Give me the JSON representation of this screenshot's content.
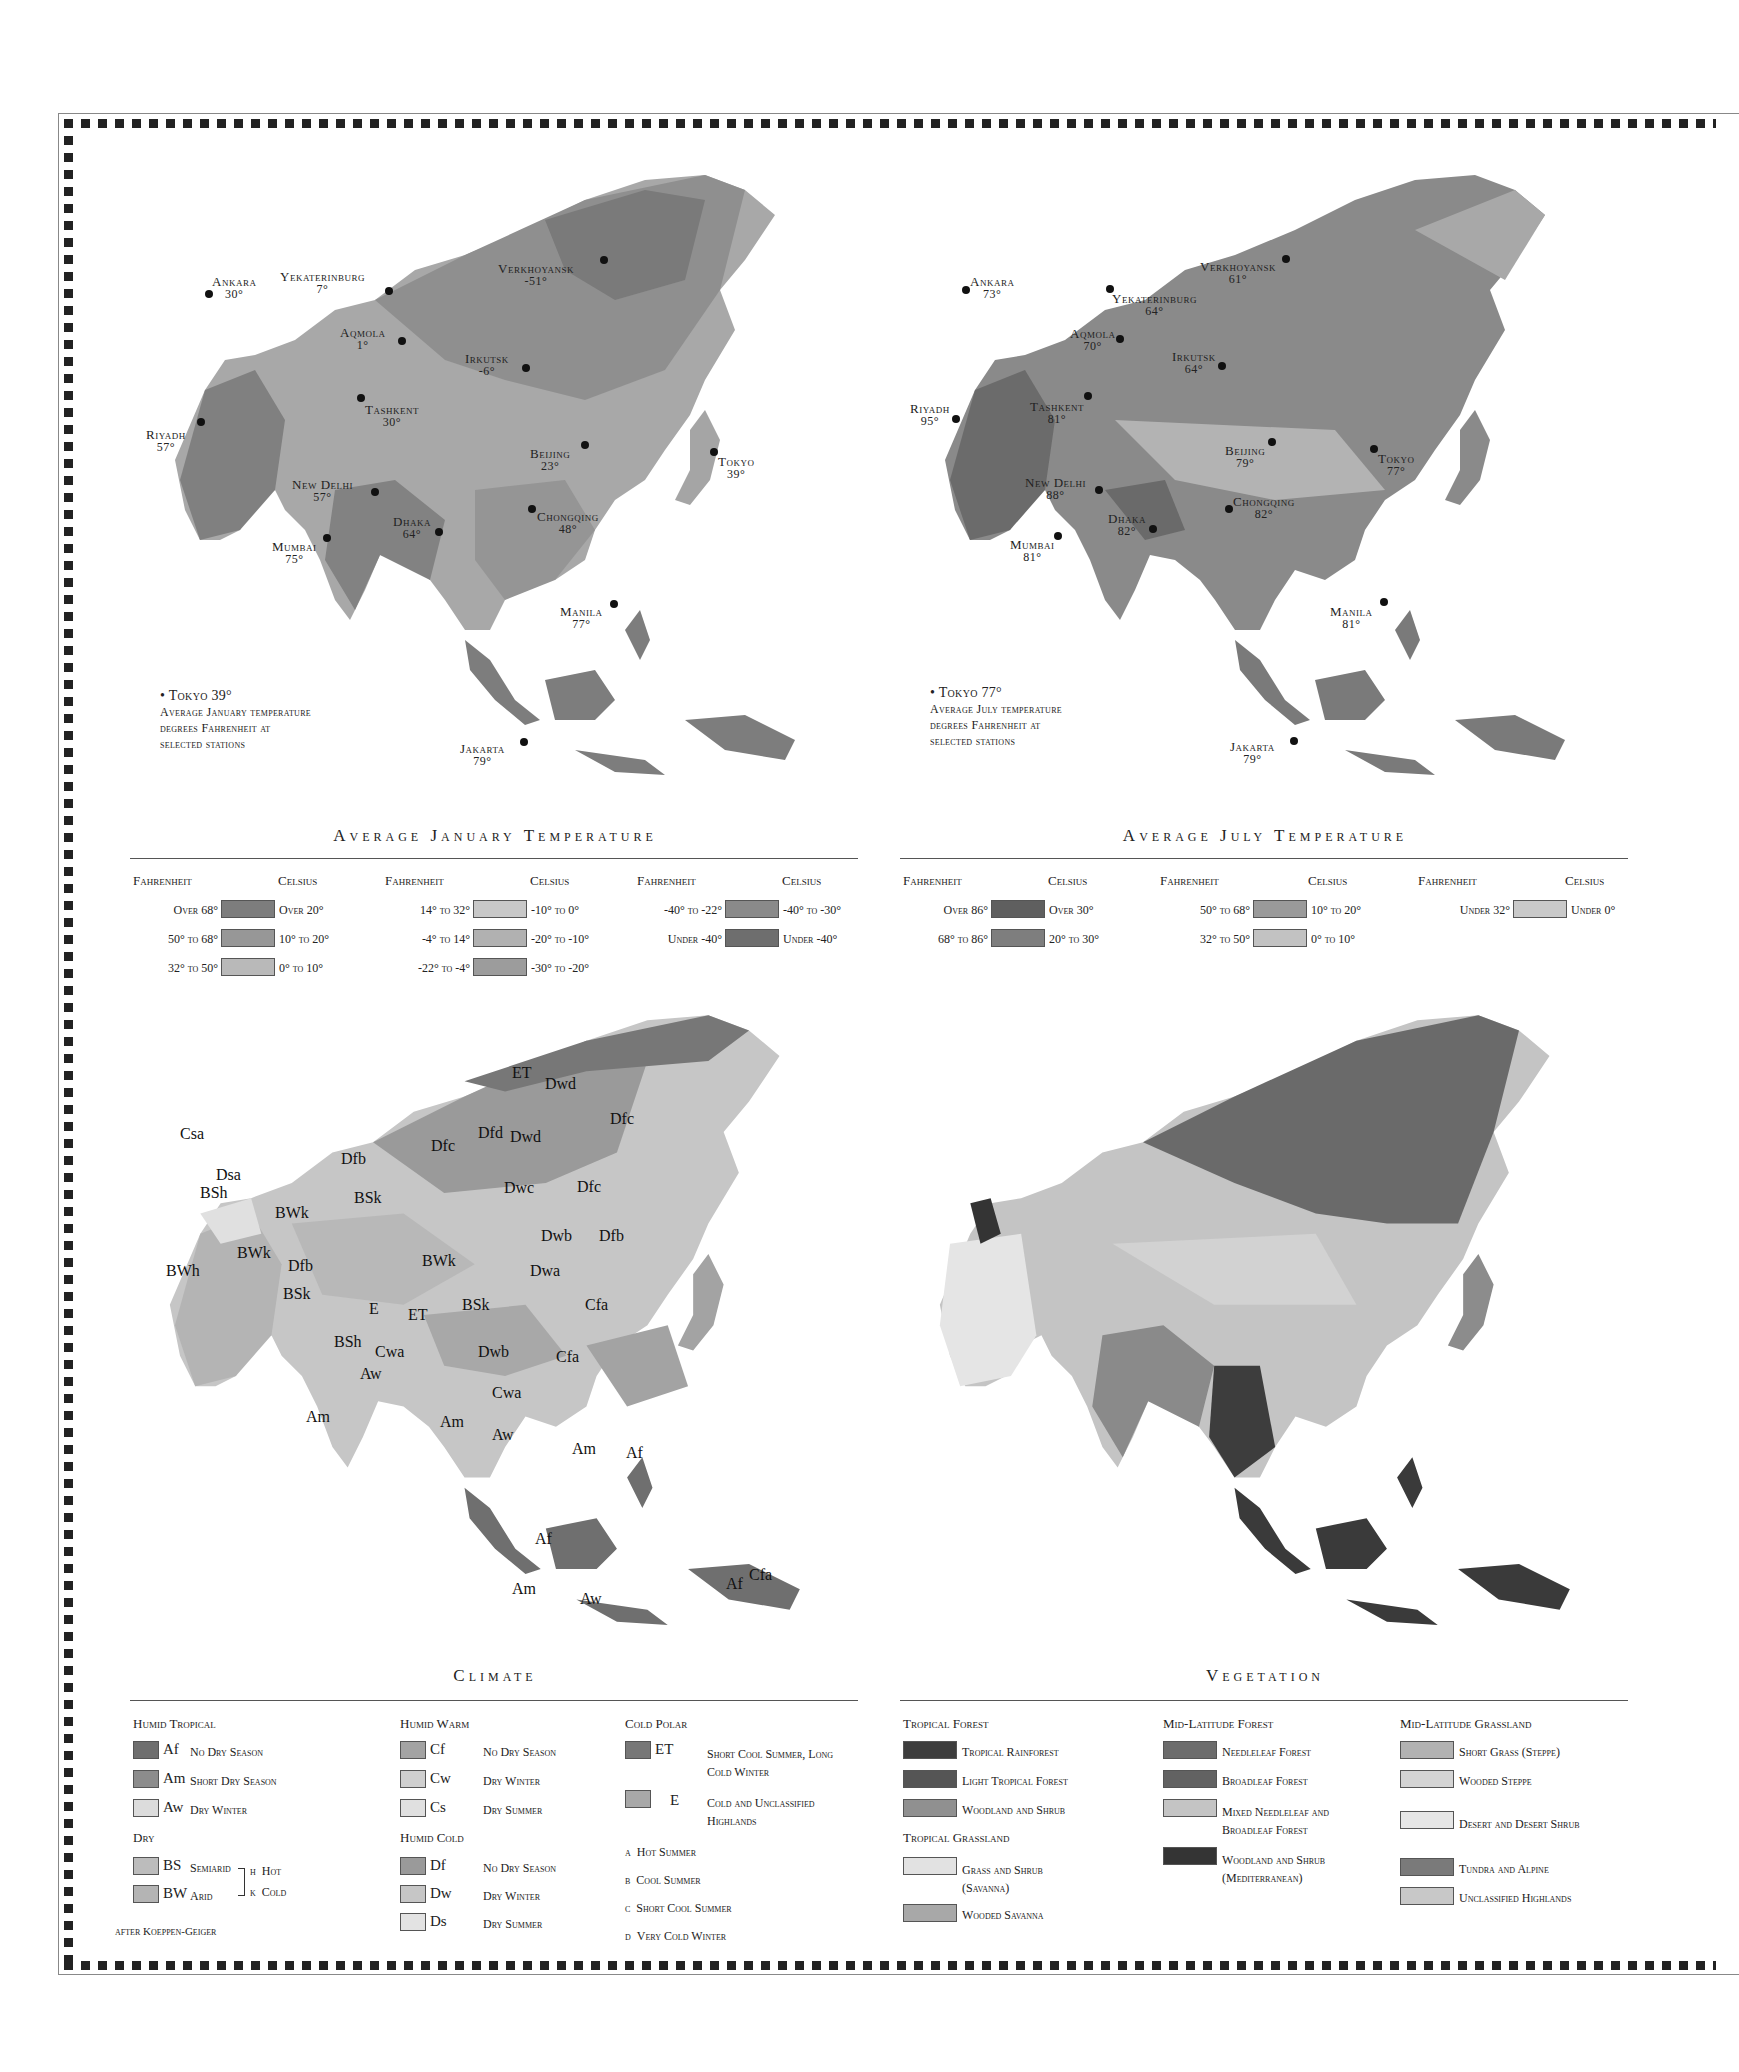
{
  "jan_map": {
    "title": "Average January Temperature",
    "note_key": "Tokyo 39°",
    "note_lines": [
      "Average January temperature",
      "degrees Fahrenheit at",
      "selected stations"
    ],
    "stations": [
      {
        "name": "Ankara",
        "temp": "30°"
      },
      {
        "name": "Yekaterinburg",
        "temp": "7°"
      },
      {
        "name": "Verkhoyansk",
        "temp": "-51°"
      },
      {
        "name": "Aqmola",
        "temp": "1°"
      },
      {
        "name": "Irkutsk",
        "temp": "-6°"
      },
      {
        "name": "Tashkent",
        "temp": "30°"
      },
      {
        "name": "Riyadh",
        "temp": "57°"
      },
      {
        "name": "Beijing",
        "temp": "23°"
      },
      {
        "name": "Tokyo",
        "temp": "39°"
      },
      {
        "name": "New Delhi",
        "temp": "57°"
      },
      {
        "name": "Dhaka",
        "temp": "64°"
      },
      {
        "name": "Chongqing",
        "temp": "48°"
      },
      {
        "name": "Mumbai",
        "temp": "75°"
      },
      {
        "name": "Manila",
        "temp": "77°"
      },
      {
        "name": "Jakarta",
        "temp": "79°"
      }
    ]
  },
  "jan_legend": {
    "fahrenheit_label": "Fahrenheit",
    "celsius_label": "Celsius",
    "items": [
      {
        "f": "Over 68°",
        "c": "Over 20°",
        "color": "#7d7d7d"
      },
      {
        "f": "50° to 68°",
        "c": "10° to 20°",
        "color": "#979797"
      },
      {
        "f": "32° to 50°",
        "c": "0° to 10°",
        "color": "#b9b9b9"
      },
      {
        "f": "14° to 32°",
        "c": "-10° to 0°",
        "color": "#c8c8c8"
      },
      {
        "f": "-4° to 14°",
        "c": "-20° to -10°",
        "color": "#b1b1b1"
      },
      {
        "f": "-22° to -4°",
        "c": "-30° to -20°",
        "color": "#9c9c9c"
      },
      {
        "f": "-40° to -22°",
        "c": "-40° to -30°",
        "color": "#8a8a8a"
      },
      {
        "f": "Under -40°",
        "c": "Under -40°",
        "color": "#6e6e6e"
      }
    ]
  },
  "jul_map": {
    "title": "Average July Temperature",
    "note_key": "Tokyo 77°",
    "note_lines": [
      "Average July temperature",
      "degrees Fahrenheit at",
      "selected stations"
    ],
    "stations": [
      {
        "name": "Ankara",
        "temp": "73°"
      },
      {
        "name": "Yekaterinburg",
        "temp": "64°"
      },
      {
        "name": "Verkhoyansk",
        "temp": "61°"
      },
      {
        "name": "Aqmola",
        "temp": "70°"
      },
      {
        "name": "Irkutsk",
        "temp": "64°"
      },
      {
        "name": "Tashkent",
        "temp": "81°"
      },
      {
        "name": "Riyadh",
        "temp": "95°"
      },
      {
        "name": "Beijing",
        "temp": "79°"
      },
      {
        "name": "Tokyo",
        "temp": "77°"
      },
      {
        "name": "New Delhi",
        "temp": "88°"
      },
      {
        "name": "Dhaka",
        "temp": "82°"
      },
      {
        "name": "Chongqing",
        "temp": "82°"
      },
      {
        "name": "Mumbai",
        "temp": "81°"
      },
      {
        "name": "Manila",
        "temp": "81°"
      },
      {
        "name": "Jakarta",
        "temp": "79°"
      }
    ]
  },
  "jul_legend": {
    "fahrenheit_label": "Fahrenheit",
    "celsius_label": "Celsius",
    "items": [
      {
        "f": "Over 86°",
        "c": "Over 30°",
        "color": "#5f5f5f"
      },
      {
        "f": "68° to 86°",
        "c": "20° to 30°",
        "color": "#7e7e7e"
      },
      {
        "f": "50° to 68°",
        "c": "10° to 20°",
        "color": "#9a9a9a"
      },
      {
        "f": "32° to 50°",
        "c": "0° to 10°",
        "color": "#c2c2c2"
      },
      {
        "f": "Under 32°",
        "c": "Under 0°",
        "color": "#c9c9c9"
      }
    ]
  },
  "climate_map": {
    "title": "Climate",
    "zone_labels": [
      "ET",
      "Dwd",
      "Dfc",
      "Csa",
      "Dfd",
      "Dwd",
      "Dfc",
      "Dfb",
      "Dsa",
      "BSh",
      "BSk",
      "Dwc",
      "Dfc",
      "BWk",
      "Dwb",
      "Dfb",
      "BWh",
      "BWk",
      "Dfb",
      "BWk",
      "Dwa",
      "BSk",
      "E",
      "ET",
      "BSk",
      "Cfa",
      "BSh",
      "Cwa",
      "Dwb",
      "Cfa",
      "Aw",
      "Cwa",
      "Am",
      "Am",
      "Aw",
      "Am",
      "Af",
      "Af",
      "Am",
      "Aw",
      "Af",
      "Cfa"
    ]
  },
  "climate_legend": {
    "source": "after Koeppen-Geiger",
    "groups": [
      {
        "title": "Humid Tropical",
        "items": [
          {
            "code": "Af",
            "label": "No Dry Season",
            "color": "#6f6f6f"
          },
          {
            "code": "Am",
            "label": "Short Dry Season",
            "color": "#8c8c8c"
          },
          {
            "code": "Aw",
            "label": "Dry Winter",
            "color": "#dcdcdc"
          }
        ]
      },
      {
        "title": "Dry",
        "items": [
          {
            "code": "BS",
            "label": "Semiarid",
            "color": "#bcbcbc"
          },
          {
            "code": "BW",
            "label": "Arid",
            "color": "#b4b4b4"
          }
        ]
      },
      {
        "title": "Humid Warm",
        "items": [
          {
            "code": "Cf",
            "label": "No Dry Season",
            "color": "#a3a3a3"
          },
          {
            "code": "Cw",
            "label": "Dry Winter",
            "color": "#cfcfcf"
          },
          {
            "code": "Cs",
            "label": "Dry Summer",
            "color": "#e0e0e0"
          }
        ]
      },
      {
        "title": "Humid Cold",
        "items": [
          {
            "code": "Df",
            "label": "No Dry Season",
            "color": "#9a9a9a"
          },
          {
            "code": "Dw",
            "label": "Dry Winter",
            "color": "#c6c6c6"
          },
          {
            "code": "Ds",
            "label": "Dry Summer",
            "color": "#e3e3e3"
          }
        ]
      },
      {
        "title": "Cold Polar",
        "items": [
          {
            "code": "ET",
            "label": "Short Cool Summer, Long Cold Winter",
            "color": "#777777"
          },
          {
            "code": "E",
            "label": "Cold and Unclassified Highlands",
            "color": "#a8a8a8"
          }
        ]
      }
    ],
    "dry_modifiers": [
      {
        "code": "h",
        "label": "Hot"
      },
      {
        "code": "k",
        "label": "Cold"
      }
    ],
    "letter_modifiers": [
      {
        "code": "a",
        "label": "Hot Summer"
      },
      {
        "code": "b",
        "label": "Cool Summer"
      },
      {
        "code": "c",
        "label": "Short Cool Summer"
      },
      {
        "code": "d",
        "label": "Very Cold Winter"
      }
    ]
  },
  "vegetation_map": {
    "title": "Vegetation"
  },
  "vegetation_legend": {
    "groups": [
      {
        "title": "Tropical Forest",
        "items": [
          {
            "label": "Tropical Rainforest",
            "color": "#3d3d3d"
          },
          {
            "label": "Light Tropical Forest",
            "color": "#555555"
          },
          {
            "label": "Woodland and Shrub",
            "color": "#909090"
          }
        ]
      },
      {
        "title": "Tropical Grassland",
        "items": [
          {
            "label": "Grass and Shrub (Savanna)",
            "color": "#e2e2e2"
          },
          {
            "label": "Wooded Savanna",
            "color": "#a8a8a8"
          }
        ]
      },
      {
        "title": "Mid-Latitude Forest",
        "items": [
          {
            "label": "Needleleaf Forest",
            "color": "#6c6c6c"
          },
          {
            "label": "Broadleaf Forest",
            "color": "#626262"
          },
          {
            "label": "Mixed Needleleaf and Broadleaf Forest",
            "color": "#c4c4c4"
          },
          {
            "label": "Woodland and Shrub (Mediterranean)",
            "color": "#343434"
          }
        ]
      },
      {
        "title": "Mid-Latitude Grassland",
        "items": [
          {
            "label": "Short Grass (Steppe)",
            "color": "#b2b2b2"
          },
          {
            "label": "Wooded Steppe",
            "color": "#d4d4d4"
          },
          {
            "label": "Desert and Desert Shrub",
            "color": "#e6e6e6"
          },
          {
            "label": "Tundra and Alpine",
            "color": "#7a7a7a"
          },
          {
            "label": "Unclassified Highlands",
            "color": "#c8c8c8"
          }
        ]
      }
    ]
  }
}
